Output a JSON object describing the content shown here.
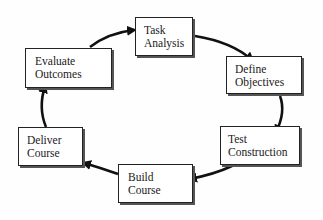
{
  "diagram": {
    "type": "cycle",
    "direction": "clockwise",
    "colors": {
      "box_border": "#222222",
      "box_shadow": "#555555",
      "arrow": "#111111",
      "text": "#1a1a1a",
      "background": "#ffffff"
    },
    "nodes": [
      {
        "id": "task-analysis",
        "line1": "Task",
        "line2": "Analysis"
      },
      {
        "id": "define-objectives",
        "line1": "Define",
        "line2": "Objectives"
      },
      {
        "id": "test-construction",
        "line1": "Test",
        "line2": "Construction"
      },
      {
        "id": "build-course",
        "line1": "Build",
        "line2": "Course"
      },
      {
        "id": "deliver-course",
        "line1": "Deliver",
        "line2": "Course"
      },
      {
        "id": "evaluate-outcomes",
        "line1": "Evaluate",
        "line2": "Outcomes"
      }
    ],
    "edges": [
      {
        "from": "task-analysis",
        "to": "define-objectives"
      },
      {
        "from": "define-objectives",
        "to": "test-construction"
      },
      {
        "from": "test-construction",
        "to": "build-course"
      },
      {
        "from": "build-course",
        "to": "deliver-course"
      },
      {
        "from": "deliver-course",
        "to": "evaluate-outcomes"
      },
      {
        "from": "evaluate-outcomes",
        "to": "task-analysis"
      }
    ]
  }
}
